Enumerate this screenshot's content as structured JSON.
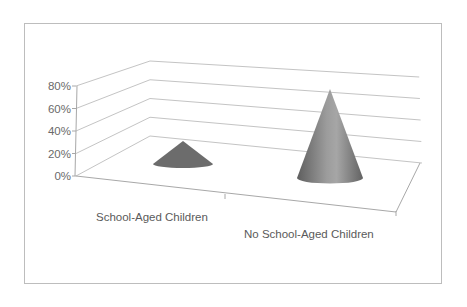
{
  "chart_data": {
    "type": "bar",
    "subtype": "3d-cone",
    "title": "",
    "xlabel": "",
    "ylabel": "",
    "categories": [
      "School-Aged Children",
      "No School-Aged Children"
    ],
    "values": [
      20,
      77
    ],
    "value_format": "percent",
    "ylim": [
      0,
      80
    ],
    "yticks": [
      "0%",
      "20%",
      "40%",
      "60%",
      "80%"
    ],
    "grid": true,
    "legend": null,
    "colors": {
      "cone_fill": "#6e6e6e",
      "cone_highlight": "#a9a9a9",
      "gridline": "#c4c4c4",
      "frame": "#bdbdbd"
    }
  }
}
